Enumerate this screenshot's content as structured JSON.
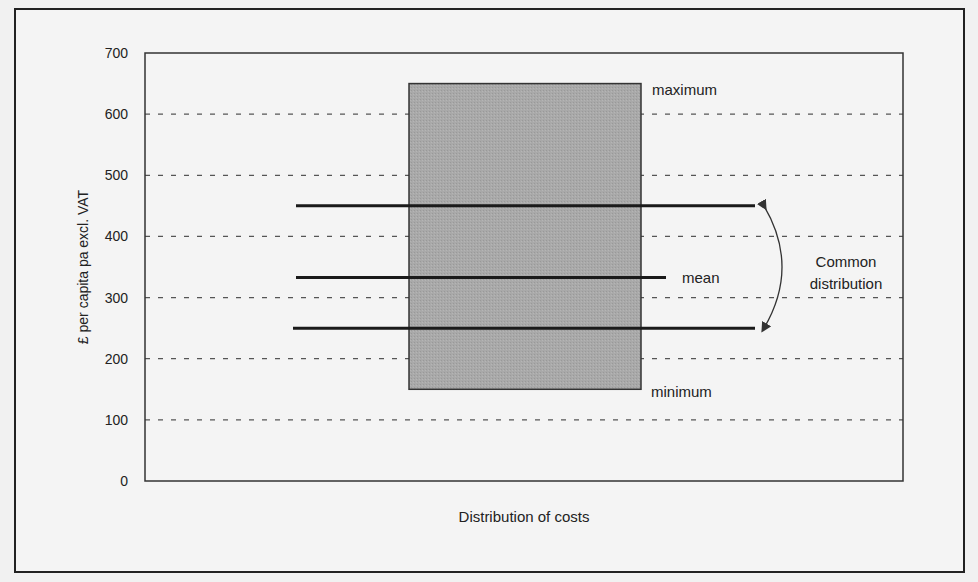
{
  "chart_data": {
    "type": "box",
    "title": "",
    "xlabel": "Distribution of costs",
    "ylabel": "£ per capita pa excl. VAT",
    "ylim": [
      0,
      700
    ],
    "yticks": [
      0,
      100,
      200,
      300,
      400,
      500,
      600,
      700
    ],
    "grid": "dashed horizontal",
    "box": {
      "minimum": 150,
      "maximum": 650
    },
    "lines": [
      {
        "name": "upper common distribution",
        "value": 450
      },
      {
        "name": "mean",
        "value": 333
      },
      {
        "name": "lower common distribution",
        "value": 250
      }
    ],
    "annotations": {
      "maximum": "maximum",
      "minimum": "minimum",
      "mean": "mean",
      "common_1": "Common",
      "common_2": "distribution"
    }
  }
}
